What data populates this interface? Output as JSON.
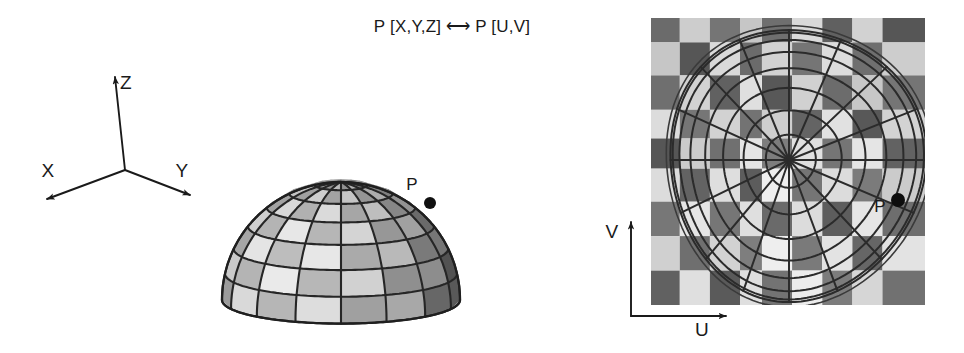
{
  "figure": {
    "background_color": "#ffffff",
    "ink_color": "#1a1a1a",
    "width": 964,
    "height": 353
  },
  "mapping_note": {
    "text": "P [X,Y,Z] ⟷ P [U,V]",
    "x": 452,
    "y": 26
  },
  "world_axes": {
    "name": "3D world coordinate axes",
    "origin": {
      "x": 125,
      "y": 170
    },
    "axes": [
      {
        "id": "z",
        "label": "Z",
        "tip_x": 115,
        "tip_y": 77,
        "label_x": 126,
        "label_y": 82
      },
      {
        "id": "x",
        "label": "X",
        "tip_x": 47,
        "tip_y": 199,
        "label_x": 48,
        "label_y": 170
      },
      {
        "id": "y",
        "label": "Y",
        "tip_x": 190,
        "tip_y": 195,
        "label_x": 182,
        "label_y": 170
      }
    ]
  },
  "dome": {
    "name": "shaded hemisphere wireframe",
    "center_x": 341,
    "base_y": 300,
    "radius_x": 119,
    "radius_y": 118,
    "meridians": 16,
    "parallels": 7,
    "point": {
      "label": "P",
      "x": 430,
      "y": 203,
      "label_x": 412,
      "label_y": 184,
      "dot_radius": 6
    }
  },
  "texture_map": {
    "name": "UV texture map with polar grid",
    "left": 651,
    "top": 18,
    "width": 274,
    "height": 287,
    "checker_cols": 8,
    "checker_rows": 8,
    "checker_light": "#d5d5d5",
    "checker_dark": "#686868",
    "polar_center_x": 789,
    "polar_center_y": 160,
    "rings": 8,
    "spokes": 16,
    "point": {
      "label": "P",
      "x": 898,
      "y": 200,
      "label_x": 880,
      "label_y": 206,
      "dot_radius": 7
    }
  },
  "uv_axes": {
    "name": "UV coordinate axes",
    "corner": {
      "x": 631,
      "y": 316
    },
    "axes": [
      {
        "id": "v",
        "label": "V",
        "tip_x": 631,
        "tip_y": 222,
        "label_x": 612,
        "label_y": 231
      },
      {
        "id": "u",
        "label": "U",
        "tip_x": 726,
        "tip_y": 316,
        "label_x": 702,
        "label_y": 329
      }
    ]
  }
}
